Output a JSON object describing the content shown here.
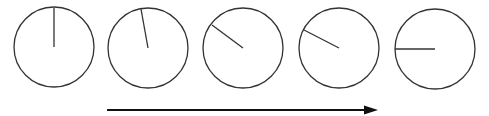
{
  "diagram": {
    "stroke_color": "#333333",
    "circles": [
      {
        "cx": 54,
        "cy": 47,
        "r": 40,
        "hand_x": 54,
        "hand_y": 8
      },
      {
        "cx": 148,
        "cy": 48,
        "r": 40,
        "hand_x": 141,
        "hand_y": 9
      },
      {
        "cx": 243,
        "cy": 48,
        "r": 40,
        "hand_x": 212,
        "hand_y": 25
      },
      {
        "cx": 339,
        "cy": 48,
        "r": 40,
        "hand_x": 304,
        "hand_y": 30
      },
      {
        "cx": 435,
        "cy": 49,
        "r": 40,
        "hand_x": 395,
        "hand_y": 49
      }
    ],
    "arrow": {
      "x1": 107,
      "y1": 110,
      "x2": 378,
      "y2": 110,
      "direction": "right"
    }
  }
}
